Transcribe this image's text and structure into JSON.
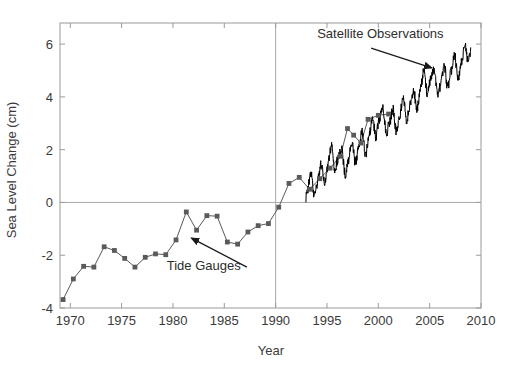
{
  "figure": {
    "background_color": "#ffffff",
    "axis_color": "#9a9a9a",
    "text_color": "#3a3a3a"
  },
  "chart_data": {
    "type": "line",
    "title": "",
    "subtitle": "",
    "xlabel": "Year",
    "ylabel": "Sea Level Change (cm)",
    "xlim": [
      1969,
      2010
    ],
    "ylim": [
      -4,
      6.8
    ],
    "xticks": [
      1970,
      1975,
      1980,
      1985,
      1990,
      1995,
      2000,
      2005,
      2010
    ],
    "xticklabels": [
      "1970",
      "1975",
      "1980",
      "1985",
      "1990",
      "1995",
      "2000",
      "2005",
      "2010"
    ],
    "yticks": [
      -4,
      -2,
      0,
      2,
      4,
      6
    ],
    "yticklabels": [
      "-4",
      "-2",
      "0",
      "2",
      "4",
      "6"
    ],
    "grid": false,
    "legend_position": "none",
    "reference_lines": [
      {
        "name": "zero-line",
        "orientation": "horizontal",
        "value": 0,
        "color": "#a8a8a8"
      },
      {
        "name": "year-1990-line",
        "orientation": "vertical",
        "value": 1990,
        "color": "#a8a8a8"
      }
    ],
    "annotations": [
      {
        "name": "satellite-observations-annotation",
        "text": "Satellite Observations",
        "text_x": 2000.2,
        "text_y": 6.25,
        "arrow_from_x": 1999.3,
        "arrow_from_y": 5.85,
        "arrow_to_x": 2005.2,
        "arrow_to_y": 5.1,
        "color": "#2d2d2d"
      },
      {
        "name": "tide-gauges-annotation",
        "text": "Tide Gauges",
        "text_x": 1983.0,
        "text_y": -2.55,
        "arrow_from_x": 1987.2,
        "arrow_from_y": -2.45,
        "arrow_to_x": 1981.8,
        "arrow_to_y": -1.35,
        "color": "#2d2d2d"
      }
    ],
    "series": [
      {
        "name": "Tide Gauges",
        "style": "line-with-markers",
        "color": "#5a5a5a",
        "marker": "square",
        "marker_size": 2.4,
        "line_width": 1.0,
        "x": [
          1969.3,
          1970.3,
          1971.3,
          1972.3,
          1973.3,
          1974.3,
          1975.3,
          1976.3,
          1977.3,
          1978.3,
          1979.3,
          1980.3,
          1981.3,
          1982.3,
          1983.3,
          1984.3,
          1985.3,
          1986.3,
          1987.3,
          1988.3,
          1989.3,
          1990.3,
          1991.3,
          1992.3,
          1993.3,
          1994.3,
          1995.3,
          1996.3,
          1997.0,
          1997.6,
          1998.3,
          1999.0,
          2000.0,
          2001.0
        ],
        "y": [
          -3.68,
          -2.9,
          -2.42,
          -2.45,
          -1.68,
          -1.82,
          -2.12,
          -2.45,
          -2.08,
          -1.95,
          -1.98,
          -1.42,
          -0.36,
          -1.05,
          -0.5,
          -0.52,
          -1.5,
          -1.58,
          -1.12,
          -0.88,
          -0.8,
          -0.18,
          0.72,
          0.95,
          0.5,
          0.9,
          1.3,
          1.75,
          2.8,
          2.55,
          2.25,
          3.15,
          3.3,
          3.35
        ]
      },
      {
        "name": "Satellite Observations",
        "style": "line",
        "color": "#000000",
        "line_width": 1.0,
        "note": "10-day altimetry sampling from 1993 to 2009, linear trend ~3.2 mm/yr with annual + sub-annual variability",
        "start_year": 1992.95,
        "end_year": 2009.0,
        "trend_cm_per_year": 0.32,
        "intercept_cm_at_1993": 0.55,
        "annual_amplitude_cm": 0.42,
        "noise_amplitude_cm": 0.2,
        "samples_per_year": 36
      }
    ]
  }
}
